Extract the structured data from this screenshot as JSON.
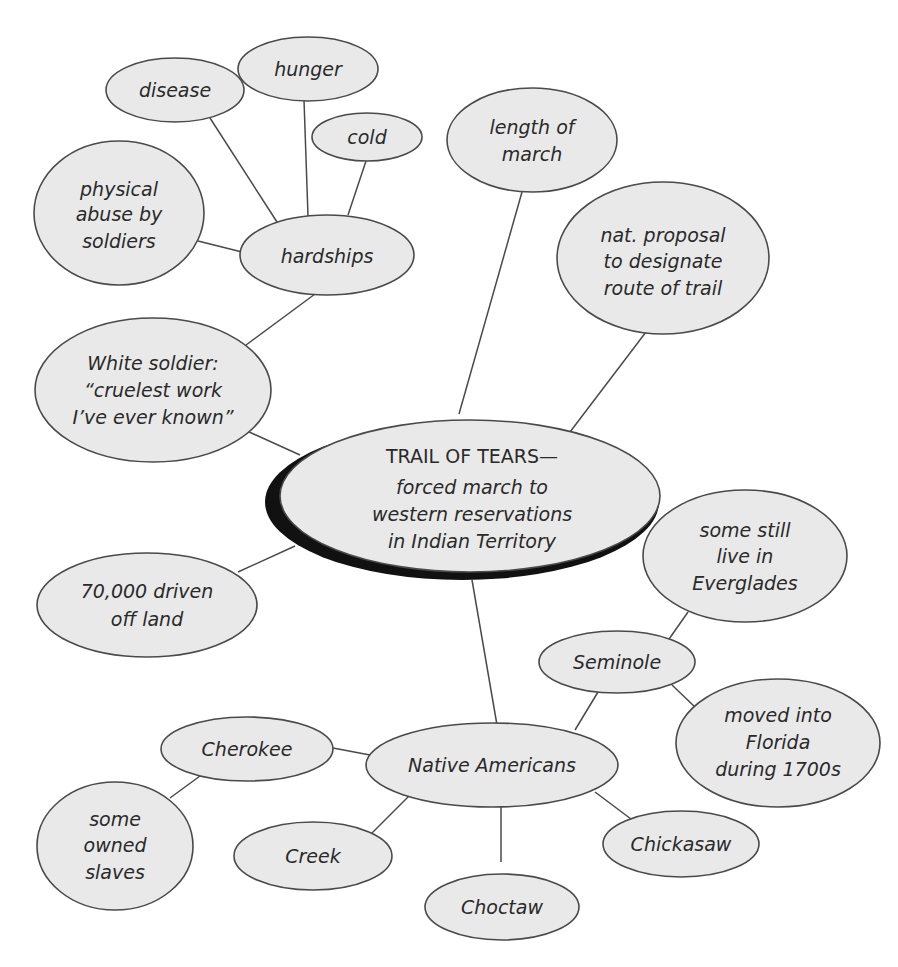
{
  "diagram": {
    "type": "concept-map",
    "center": {
      "id": "trail",
      "lines": [
        "TRAIL OF TEARS—",
        "forced march to",
        "western reservations",
        "in Indian Territory"
      ]
    },
    "nodes": [
      {
        "id": "disease",
        "lines": [
          "disease"
        ]
      },
      {
        "id": "hunger",
        "lines": [
          "hunger"
        ]
      },
      {
        "id": "cold",
        "lines": [
          "cold"
        ]
      },
      {
        "id": "abuse",
        "lines": [
          "physical",
          "abuse by",
          "soldiers"
        ]
      },
      {
        "id": "hardships",
        "lines": [
          "hardships"
        ]
      },
      {
        "id": "length",
        "lines": [
          "length of",
          "march"
        ]
      },
      {
        "id": "proposal",
        "lines": [
          "nat. proposal",
          "to designate",
          "route of trail"
        ]
      },
      {
        "id": "soldier",
        "lines": [
          "White soldier:",
          "“cruelest work",
          "I’ve ever known”"
        ]
      },
      {
        "id": "driven",
        "lines": [
          "70,000 driven",
          "off land"
        ]
      },
      {
        "id": "everglades",
        "lines": [
          "some still",
          "live in",
          "Everglades"
        ]
      },
      {
        "id": "seminole",
        "lines": [
          "Seminole"
        ]
      },
      {
        "id": "florida",
        "lines": [
          "moved into",
          "Florida",
          "during 1700s"
        ]
      },
      {
        "id": "cherokee",
        "lines": [
          "Cherokee"
        ]
      },
      {
        "id": "native",
        "lines": [
          "Native Americans"
        ]
      },
      {
        "id": "slaves",
        "lines": [
          "some",
          "owned",
          "slaves"
        ]
      },
      {
        "id": "creek",
        "lines": [
          "Creek"
        ]
      },
      {
        "id": "choctaw",
        "lines": [
          "Choctaw"
        ]
      },
      {
        "id": "chickasaw",
        "lines": [
          "Chickasaw"
        ]
      }
    ],
    "edges": [
      [
        "disease",
        "hardships"
      ],
      [
        "hunger",
        "hardships"
      ],
      [
        "cold",
        "hardships"
      ],
      [
        "abuse",
        "hardships"
      ],
      [
        "hardships",
        "soldier"
      ],
      [
        "soldier",
        "trail"
      ],
      [
        "length",
        "trail"
      ],
      [
        "proposal",
        "trail"
      ],
      [
        "driven",
        "trail"
      ],
      [
        "trail",
        "native"
      ],
      [
        "native",
        "seminole"
      ],
      [
        "seminole",
        "everglades"
      ],
      [
        "seminole",
        "florida"
      ],
      [
        "native",
        "cherokee"
      ],
      [
        "cherokee",
        "slaves"
      ],
      [
        "native",
        "creek"
      ],
      [
        "native",
        "choctaw"
      ],
      [
        "native",
        "chickasaw"
      ]
    ]
  }
}
